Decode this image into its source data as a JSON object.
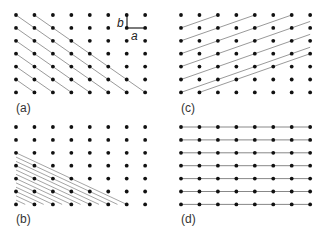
{
  "figure": {
    "lattice": {
      "columns": 8,
      "rows": 7
    },
    "colors": {
      "dot": "#111111",
      "line": "#9a9a9a",
      "vector": "#222222",
      "horizontal_line": "#888888"
    },
    "vectors": {
      "a_label": "a",
      "b_label": "b"
    },
    "panels": [
      {
        "id": "a",
        "label": "(a)",
        "line_family": "diagonal down-right, 1 column per row"
      },
      {
        "id": "c",
        "label": "(c)",
        "line_family": "diagonal up-right, 2 columns per row"
      },
      {
        "id": "b",
        "label": "(b)",
        "line_family": "dense down-right, 3 columns per 2 rows"
      },
      {
        "id": "d",
        "label": "(d)",
        "line_family": "horizontal rows"
      }
    ]
  }
}
